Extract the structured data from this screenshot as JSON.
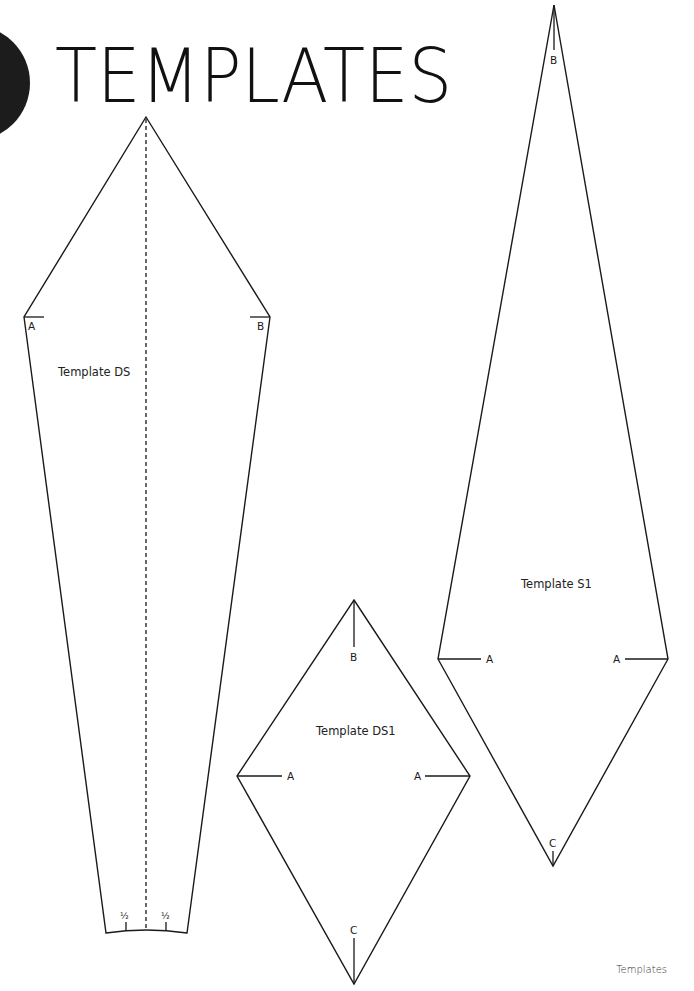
{
  "page": {
    "title": "TEMPLATES",
    "footer": "Templates",
    "accent_color": "#1c1c1c"
  },
  "templates": [
    {
      "name": "Template DS",
      "labels": {
        "left_corner": "A",
        "right_corner": "B",
        "bottom_left_half": "½",
        "bottom_right_half": "½"
      },
      "has_fold_line": true
    },
    {
      "name": "Template DS1",
      "labels": {
        "top": "B",
        "left": "A",
        "right": "A",
        "bottom": "C"
      }
    },
    {
      "name": "Template S1",
      "labels": {
        "top": "B",
        "left": "A",
        "right": "A",
        "bottom": "C"
      }
    }
  ]
}
